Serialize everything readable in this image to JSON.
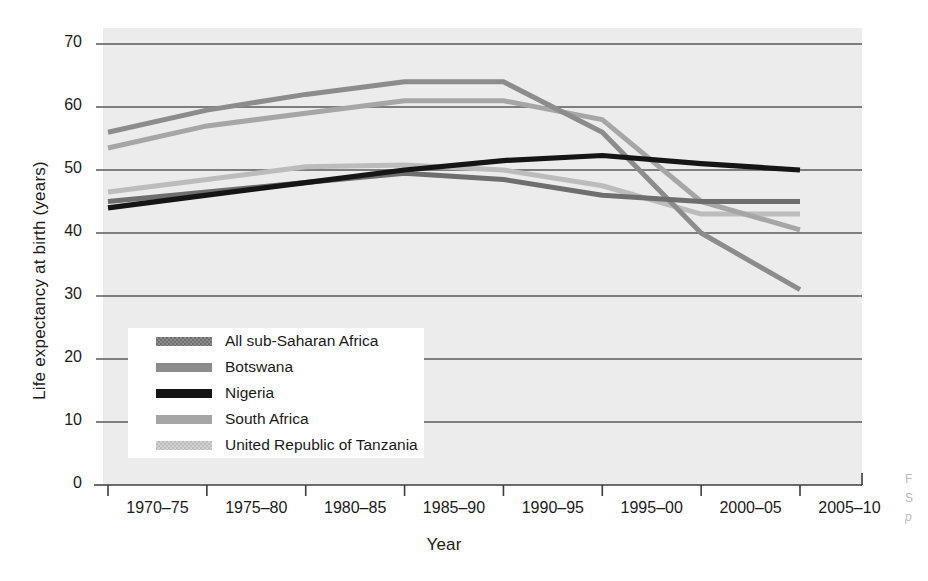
{
  "chart_data": {
    "type": "line",
    "title": "",
    "xlabel": "Year",
    "ylabel": "Life expectancy at birth (years)",
    "categories": [
      "1970–75",
      "1975–80",
      "1980–85",
      "1985–90",
      "1990–95",
      "1995–00",
      "2000–05",
      "2005–10"
    ],
    "yticks": [
      0,
      10,
      20,
      30,
      40,
      50,
      60,
      70
    ],
    "ylim": [
      0,
      70
    ],
    "grid": "horizontal",
    "legend_position": "inside-lower-left",
    "series": [
      {
        "name": "All sub-Saharan Africa",
        "color": "#6e6e6e",
        "values": [
          45.0,
          46.5,
          48.0,
          49.5,
          48.5,
          46.0,
          45.0,
          45.0
        ]
      },
      {
        "name": "Botswana",
        "color": "#8c8c8c",
        "values": [
          56.0,
          59.5,
          62.0,
          64.0,
          64.0,
          56.0,
          40.0,
          31.0
        ]
      },
      {
        "name": "Nigeria",
        "color": "#151515",
        "values": [
          44.0,
          46.0,
          48.0,
          50.0,
          51.5,
          52.3,
          51.0,
          50.0
        ]
      },
      {
        "name": "South Africa",
        "color": "#a6a6a6",
        "values": [
          53.5,
          57.0,
          59.0,
          61.0,
          61.0,
          58.0,
          45.0,
          40.5
        ]
      },
      {
        "name": "United Republic of Tanzania",
        "color": "#bcbcbc",
        "values": [
          46.5,
          48.5,
          50.5,
          50.8,
          50.0,
          47.5,
          43.0,
          43.0
        ]
      }
    ]
  },
  "style": {
    "plot_background": "#ececec",
    "gridline_color": "#5a5a5a",
    "axis_color": "#3c3c3c",
    "legend_background": "#ffffff",
    "page_background": "#ffffff"
  },
  "caption": {
    "line1": "F",
    "line2": "S",
    "line3": "p"
  }
}
